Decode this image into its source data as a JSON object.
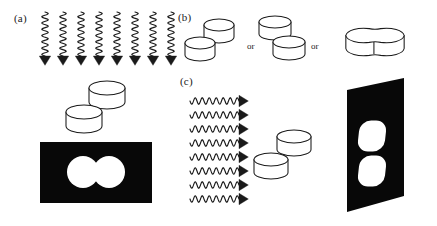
{
  "figure": {
    "type": "scientific-diagram",
    "background_color": "#ffffff",
    "ink_color": "#1a1a1a",
    "screen_color": "#080808",
    "shadow_color": "#ffffff"
  },
  "panels": {
    "a": {
      "label": "(a)",
      "wave_direction": "downward-vertical",
      "wave_count": 8,
      "wave_x_start": 45,
      "wave_x_step": 18,
      "wave_y_top": 12,
      "wave_y_bottom": 56,
      "wave_amplitude": 3.2,
      "wave_periods": 7,
      "arrow_size": 6,
      "discs": [
        {
          "cx": 107,
          "cy": 95,
          "rx": 18,
          "ry": 7,
          "height": 14
        },
        {
          "cx": 84,
          "cy": 119,
          "rx": 18,
          "ry": 7,
          "height": 14
        }
      ],
      "screen": {
        "x": 40,
        "y": 142,
        "width": 112,
        "height": 61
      },
      "shadow_type": "two-overlapping-circles",
      "shadow_blobs": [
        {
          "cx": 83,
          "cy": 172,
          "r": 16
        },
        {
          "cx": 109,
          "cy": 172,
          "r": 16
        }
      ]
    },
    "b": {
      "label": "(b)",
      "or_labels": [
        "or",
        "or"
      ],
      "options": [
        {
          "name": "offset-stacked-discs",
          "discs": [
            {
              "cx": 219,
              "cy": 31,
              "rx": 15,
              "ry": 6,
              "height": 12
            },
            {
              "cx": 200,
              "cy": 49,
              "rx": 15,
              "ry": 6,
              "height": 12
            }
          ]
        },
        {
          "name": "diagonal-separated-discs",
          "discs": [
            {
              "cx": 275,
              "cy": 28,
              "rx": 16,
              "ry": 6,
              "height": 12
            },
            {
              "cx": 289,
              "cy": 48,
              "rx": 16,
              "ry": 6,
              "height": 12
            }
          ]
        },
        {
          "name": "fused-peanut-disc",
          "center": {
            "cx": 375,
            "cy": 42
          },
          "lobe_rx": 18,
          "lobe_ry": 8,
          "height": 13
        }
      ]
    },
    "c": {
      "label": "(c)",
      "wave_direction": "rightward-horizontal",
      "wave_count": 8,
      "wave_y_start": 101,
      "wave_y_step": 14,
      "wave_x_left": 190,
      "wave_x_right": 239,
      "wave_amplitude": 3.2,
      "wave_periods": 7,
      "arrow_size": 6,
      "discs": [
        {
          "cx": 294,
          "cy": 143,
          "rx": 17,
          "ry": 6.5,
          "height": 13
        },
        {
          "cx": 271,
          "cy": 166,
          "rx": 17,
          "ry": 6.5,
          "height": 13
        }
      ],
      "screen": {
        "type": "tilted-parallelogram",
        "points": "347,90 404,78 404,196 347,212"
      },
      "shadow_type": "two-separated-rounded-rects",
      "shadow_blobs": [
        {
          "name": "upper-rounded-rect",
          "cx": 372,
          "cy": 136
        },
        {
          "name": "lower-rounded-rect",
          "cx": 372,
          "cy": 171
        }
      ]
    }
  }
}
